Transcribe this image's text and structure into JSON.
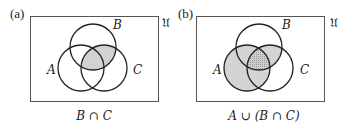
{
  "panels": [
    {
      "id": "a",
      "panel_label": "(a)",
      "universe_label": "𝔘",
      "set_labels": {
        "A": "A",
        "B": "B",
        "C": "C"
      },
      "caption": "B ∩ C",
      "shaded_region": "B ∩ C"
    },
    {
      "id": "b",
      "panel_label": "(b)",
      "universe_label": "𝔘",
      "set_labels": {
        "A": "A",
        "B": "B",
        "C": "C"
      },
      "caption": "A ∪ (B ∩ C)",
      "shaded_region": "A ∪ (B ∩ C)"
    }
  ],
  "colors": {
    "stroke": "#222222",
    "frame": "#555555",
    "shade_light": "#d4d4d4",
    "shade_dark": "#a8a8a8"
  }
}
